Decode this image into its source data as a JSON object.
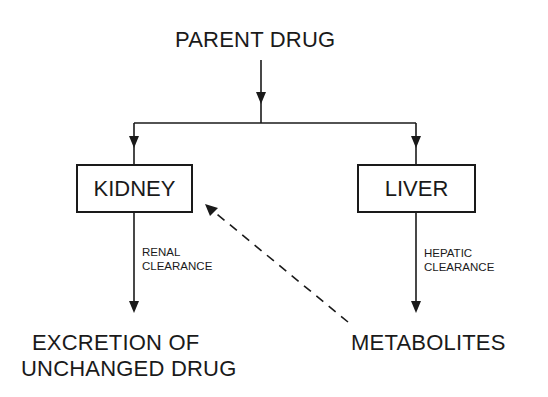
{
  "diagram": {
    "top_node": {
      "label": "PARENT DRUG"
    },
    "organs": [
      {
        "label": "KIDNEY",
        "edge_label_line1": "RENAL",
        "edge_label_line2": "CLEARANCE"
      },
      {
        "label": "LIVER",
        "edge_label_line1": "HEPATIC",
        "edge_label_line2": "CLEARANCE"
      }
    ],
    "outputs": {
      "excretion_line1": "EXCRETION OF",
      "excretion_line2": "UNCHANGED DRUG",
      "metabolites": "METABOLITES"
    },
    "edges": [
      {
        "from": "PARENT DRUG",
        "to": "KIDNEY",
        "style": "solid"
      },
      {
        "from": "PARENT DRUG",
        "to": "LIVER",
        "style": "solid"
      },
      {
        "from": "KIDNEY",
        "to": "EXCRETION OF UNCHANGED DRUG",
        "label": "RENAL CLEARANCE",
        "style": "solid"
      },
      {
        "from": "LIVER",
        "to": "METABOLITES",
        "label": "HEPATIC CLEARANCE",
        "style": "solid"
      },
      {
        "from": "METABOLITES",
        "to": "KIDNEY",
        "style": "dashed"
      }
    ],
    "colors": {
      "ink": "#1a1a1a",
      "background": "#ffffff"
    }
  }
}
